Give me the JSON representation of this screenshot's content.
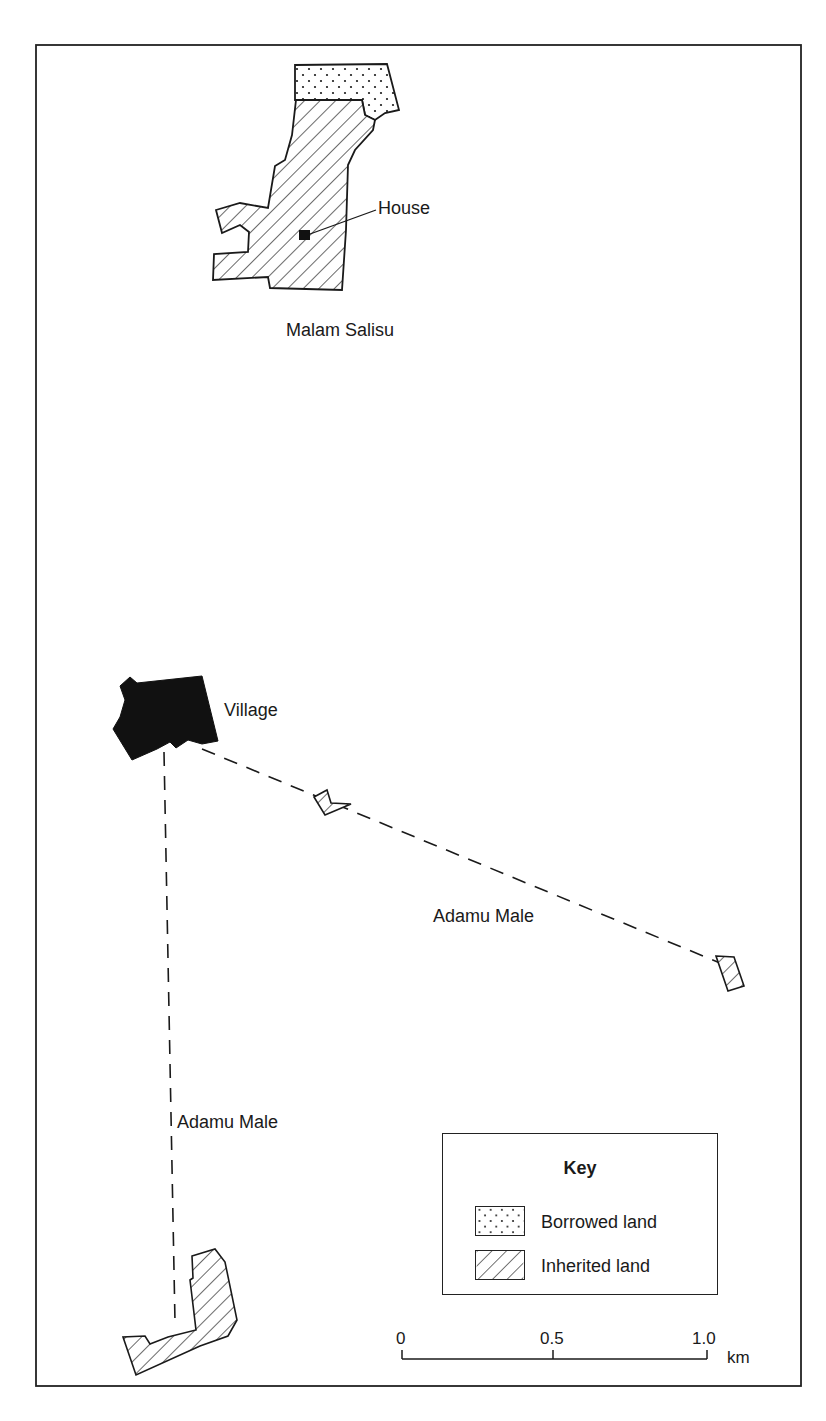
{
  "map": {
    "frame": {
      "left": 36,
      "top": 45,
      "right": 801,
      "bottom": 1386
    },
    "features": {
      "house_label": "House",
      "village_label": "Village",
      "malam_salisu_label": "Malam Salisu",
      "adamu_male_label_east": "Adamu Male",
      "adamu_male_label_south": "Adamu Male"
    },
    "colors": {
      "ink": "#1a1a1a",
      "background": "#ffffff",
      "village_fill": "#111111"
    }
  },
  "key": {
    "title": "Key",
    "items": [
      {
        "label": "Borrowed land",
        "pattern": "dots"
      },
      {
        "label": "Inherited land",
        "pattern": "diagonal-hatch"
      }
    ]
  },
  "scale_bar": {
    "ticks": [
      "0",
      "0.5",
      "1.0"
    ],
    "unit": "km"
  }
}
